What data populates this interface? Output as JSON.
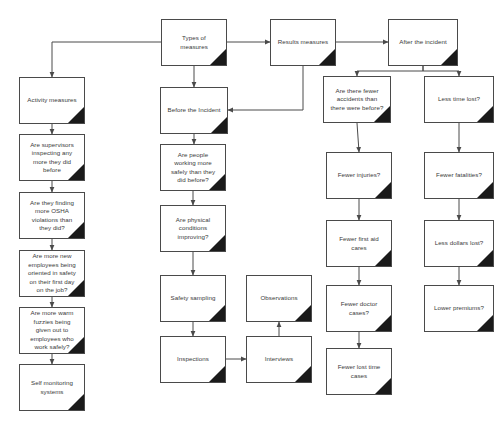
{
  "diagram": {
    "box_border_color": "#4a4a4a",
    "box_fill_color": "#ffffff",
    "fold_color": "#1a1a1a",
    "connector_color": "#4a4a4a",
    "text_color": "#3a3a3a"
  },
  "nodes": [
    {
      "id": "types-of-measures",
      "label": "Types of\nmeasures",
      "x": 161,
      "y": 19,
      "w": 66,
      "h": 47
    },
    {
      "id": "results-measures",
      "label": "Results measures",
      "x": 270,
      "y": 19,
      "w": 66,
      "h": 47
    },
    {
      "id": "after-the-incident",
      "label": "After the incident",
      "x": 388,
      "y": 19,
      "w": 70,
      "h": 47
    },
    {
      "id": "activity-measures",
      "label": "Activity measures",
      "x": 19,
      "y": 77,
      "w": 66,
      "h": 47
    },
    {
      "id": "are-supervisors-inspecting",
      "label": "Are supervisors\ninspecting any\nmore they did\nbefore",
      "x": 19,
      "y": 134,
      "w": 66,
      "h": 47
    },
    {
      "id": "are-they-finding-osha",
      "label": "Are they finding\nmore OSHA\nviolations than\nthey did?",
      "x": 19,
      "y": 192,
      "w": 66,
      "h": 47
    },
    {
      "id": "are-more-new-employees",
      "label": "Are more new\nemployees being\noriented in safety\non their first day\non the job?",
      "x": 19,
      "y": 250,
      "w": 66,
      "h": 47
    },
    {
      "id": "are-more-warm-fuzzies",
      "label": "Are more warm\nfuzzies being\ngiven out to\nemployees who\nwork safely?",
      "x": 19,
      "y": 307,
      "w": 66,
      "h": 47
    },
    {
      "id": "self-monitoring-systems",
      "label": "Self monitoring\nsystems",
      "x": 19,
      "y": 364,
      "w": 66,
      "h": 47
    },
    {
      "id": "before-the-incident",
      "label": "Before the Incident",
      "x": 160,
      "y": 87,
      "w": 68,
      "h": 47
    },
    {
      "id": "are-people-working-safely",
      "label": "Are people\nworking more\nsafely than they\ndid before?",
      "x": 160,
      "y": 144,
      "w": 66,
      "h": 47
    },
    {
      "id": "are-physical-conditions",
      "label": "Are physical\nconditions\nimproving?",
      "x": 160,
      "y": 205,
      "w": 66,
      "h": 47
    },
    {
      "id": "safety-sampling",
      "label": "Safety sampling",
      "x": 160,
      "y": 275,
      "w": 66,
      "h": 47
    },
    {
      "id": "inspections",
      "label": "Inspections",
      "x": 160,
      "y": 336,
      "w": 66,
      "h": 47
    },
    {
      "id": "interviews",
      "label": "Interviews",
      "x": 246,
      "y": 336,
      "w": 66,
      "h": 47
    },
    {
      "id": "observations",
      "label": "Observations",
      "x": 246,
      "y": 275,
      "w": 66,
      "h": 47
    },
    {
      "id": "are-there-fewer-accidents",
      "label": "Are there fewer\naccidents than\nthere were before?",
      "x": 323,
      "y": 76,
      "w": 68,
      "h": 47
    },
    {
      "id": "fewer-injuries",
      "label": "Fewer injuries?",
      "x": 326,
      "y": 152,
      "w": 66,
      "h": 47
    },
    {
      "id": "fewer-first-aid-cares",
      "label": "Fewer first aid\ncares",
      "x": 326,
      "y": 220,
      "w": 66,
      "h": 47
    },
    {
      "id": "fewer-doctor-cases",
      "label": "Fewer doctor\ncases?",
      "x": 326,
      "y": 285,
      "w": 66,
      "h": 47
    },
    {
      "id": "fewer-lost-time-cases",
      "label": "Fewer lost time\ncases",
      "x": 326,
      "y": 348,
      "w": 66,
      "h": 47
    },
    {
      "id": "less-time-lost",
      "label": "Less time lost?",
      "x": 424,
      "y": 76,
      "w": 70,
      "h": 47
    },
    {
      "id": "fewer-fatalities",
      "label": "Fewer fatalities?",
      "x": 424,
      "y": 152,
      "w": 70,
      "h": 47
    },
    {
      "id": "less-dollars-lost",
      "label": "Less dollars lost?",
      "x": 424,
      "y": 220,
      "w": 70,
      "h": 47
    },
    {
      "id": "lower-premiums",
      "label": "Lower premiums?",
      "x": 424,
      "y": 285,
      "w": 70,
      "h": 47
    }
  ],
  "connectors": [
    {
      "id": "types-to-activity",
      "points": "161,42 52,42 52,77",
      "arrow": true
    },
    {
      "id": "types-to-before",
      "points": "194,66 194,87",
      "arrow": true
    },
    {
      "id": "types-to-results",
      "points": "227,42 270,42",
      "arrow": true
    },
    {
      "id": "results-to-after",
      "points": "336,42 388,42",
      "arrow": true
    },
    {
      "id": "results-to-before",
      "points": "303,66 303,110 228,110",
      "arrow": true
    },
    {
      "id": "after-to-accidents",
      "points": "423,66 423,71 357,71 357,76",
      "arrow": true
    },
    {
      "id": "after-to-less-time-lost",
      "points": "423,66 423,71 459,71 459,76",
      "arrow": true
    },
    {
      "id": "activity-to-supervisors",
      "points": "52,124 52,134",
      "arrow": true
    },
    {
      "id": "supervisors-to-osha",
      "points": "52,181 52,192",
      "arrow": true
    },
    {
      "id": "osha-to-new-employees",
      "points": "52,239 52,250",
      "arrow": true
    },
    {
      "id": "new-employees-to-fuzzies",
      "points": "52,297 52,307",
      "arrow": true
    },
    {
      "id": "fuzzies-to-self-monitoring",
      "points": "52,354 52,364",
      "arrow": true
    },
    {
      "id": "before-to-people-working",
      "points": "194,134 194,144",
      "arrow": true
    },
    {
      "id": "people-working-to-physical",
      "points": "193,191 193,205",
      "arrow": true
    },
    {
      "id": "physical-to-safety-sampling",
      "points": "193,252 193,275",
      "arrow": true
    },
    {
      "id": "safety-sampling-to-inspections",
      "points": "193,322 193,336",
      "arrow": true
    },
    {
      "id": "inspections-to-interviews",
      "points": "226,359 246,359",
      "arrow": true
    },
    {
      "id": "interviews-to-observations",
      "points": "279,336 279,322",
      "arrow": true
    },
    {
      "id": "accidents-to-injuries",
      "points": "357,123 359,152",
      "arrow": true
    },
    {
      "id": "injuries-to-first-aid",
      "points": "359,199 359,220",
      "arrow": true
    },
    {
      "id": "first-aid-to-doctor",
      "points": "359,267 359,285",
      "arrow": true
    },
    {
      "id": "doctor-to-lost-time",
      "points": "359,332 359,348",
      "arrow": true
    },
    {
      "id": "less-time-to-fatalities",
      "points": "459,123 459,152",
      "arrow": true
    },
    {
      "id": "fatalities-to-dollars",
      "points": "459,199 459,220",
      "arrow": true
    },
    {
      "id": "dollars-to-premiums",
      "points": "459,267 459,285",
      "arrow": true
    }
  ]
}
